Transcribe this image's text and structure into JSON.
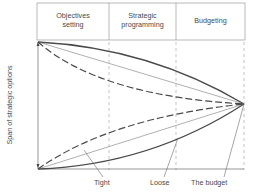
{
  "diagram": {
    "phases": [
      {
        "label": "Objectives\nsetting"
      },
      {
        "label": "Strategic\nprogramming"
      },
      {
        "label": "Budgeting"
      }
    ],
    "y_axis_label": "Span of strategic options",
    "curve_labels": {
      "tight": "Tight",
      "loose": "Loose",
      "budget": "The budget"
    },
    "colors": {
      "line": "#4a4a4a",
      "thin_line": "#7a7a7a",
      "background": "#ffffff"
    }
  }
}
